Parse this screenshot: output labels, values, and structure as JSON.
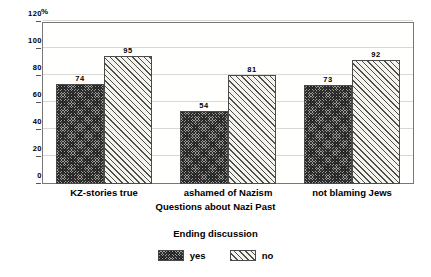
{
  "chart_data": {
    "type": "bar",
    "title": "",
    "subtitle": "",
    "xlabel": "Questions about Nazi Past",
    "ylabel": "%",
    "unit_label": "%",
    "categories": [
      "KZ-stories true",
      "ashamed of Nazism",
      "not blaming Jews"
    ],
    "series": [
      {
        "name": "yes",
        "values": [
          74,
          54,
          73
        ],
        "pattern": "cross-hatch",
        "color": "#9c9c97"
      },
      {
        "name": "no",
        "values": [
          95,
          81,
          92
        ],
        "pattern": "diagonal-stripes",
        "color": "#f4f3ee"
      }
    ],
    "ylim": [
      0,
      120
    ],
    "yticks": [
      0,
      20,
      40,
      60,
      80,
      100,
      120
    ],
    "ytick_labels": [
      "0",
      "20",
      "40",
      "60",
      "80",
      "100",
      "120"
    ],
    "grid": true,
    "grid_axis": "y",
    "legend": {
      "title": "Ending discussion",
      "position": "bottom",
      "entries": [
        "yes",
        "no"
      ]
    },
    "bar_value_labels": true
  }
}
